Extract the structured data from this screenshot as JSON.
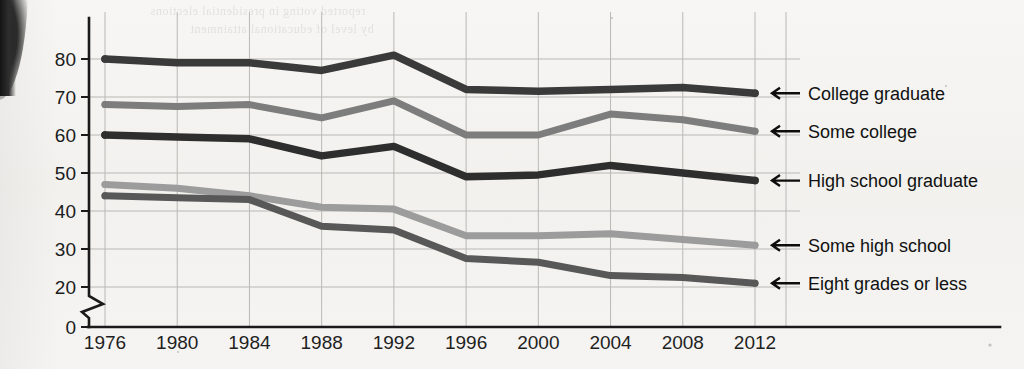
{
  "chart_data": {
    "type": "line",
    "title": "",
    "subtitle": "",
    "xlabel": "",
    "ylabel": "",
    "x": [
      1976,
      1980,
      1984,
      1988,
      1992,
      1996,
      2000,
      2004,
      2008,
      2012
    ],
    "categories": [
      "1976",
      "1980",
      "1984",
      "1988",
      "1992",
      "1996",
      "2000",
      "2004",
      "2008",
      "2012"
    ],
    "xlim": [
      1976,
      2012
    ],
    "ylim": [
      0,
      85
    ],
    "y_ticks": [
      "0",
      "20",
      "30",
      "40",
      "50",
      "60",
      "70",
      "80"
    ],
    "y_axis_break": true,
    "y_axis_break_note": "axis broken between 0 and 20",
    "grid": true,
    "legend_position": "right-inline-arrows",
    "series": [
      {
        "name": "College graduate",
        "color": "#3a3a3a",
        "values": [
          80,
          79,
          79,
          77,
          81,
          72,
          71.5,
          72,
          72.5,
          71
        ]
      },
      {
        "name": "Some college",
        "color": "#7d7d7d",
        "values": [
          68,
          67.5,
          68,
          64.5,
          69,
          60,
          60,
          65.5,
          64,
          61
        ]
      },
      {
        "name": "High school graduate",
        "color": "#2e2e2e",
        "values": [
          60,
          59.5,
          59,
          54.5,
          57,
          49,
          49.5,
          52,
          50,
          48
        ]
      },
      {
        "name": "Some high school",
        "color": "#9c9c9c",
        "values": [
          47,
          46,
          44,
          41,
          40.5,
          33.5,
          33.5,
          34,
          32.5,
          31
        ]
      },
      {
        "name": "Eight grades or less",
        "color": "#585858",
        "values": [
          44,
          43.5,
          43,
          36,
          35,
          27.5,
          26.5,
          23,
          22.5,
          21
        ]
      }
    ]
  },
  "legend": {
    "arrow_glyph": "left-arrow",
    "items": [
      {
        "label": "College graduate"
      },
      {
        "label": "Some college"
      },
      {
        "label": "High school graduate"
      },
      {
        "label": "Some high school"
      },
      {
        "label": "Eight grades or less"
      }
    ]
  },
  "page": {
    "bleed_text_top": "reported voting in presidential elections",
    "bleed_text_second": "by level of educational attainment"
  }
}
